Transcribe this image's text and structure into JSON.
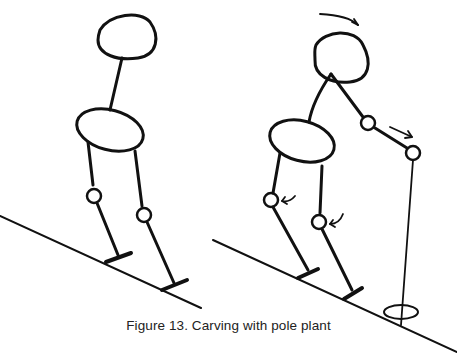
{
  "figure": {
    "caption": "Figure 13. Carving with pole plant",
    "stroke_color": "#111111",
    "background": "#ffffff"
  },
  "panels": [
    {
      "id": "left",
      "description": "Skier stick figure standing on slope, neutral stance"
    },
    {
      "id": "right",
      "description": "Skier stick figure carving with pole plant; arrows show head rotation, arm push and knee angulation"
    }
  ],
  "annotations": {
    "head_arrow": "curved-arrow-right",
    "arm_arrow": "arrow-right-down",
    "knee_arrows": [
      "curved-arrow-left",
      "curved-arrow-left"
    ]
  }
}
